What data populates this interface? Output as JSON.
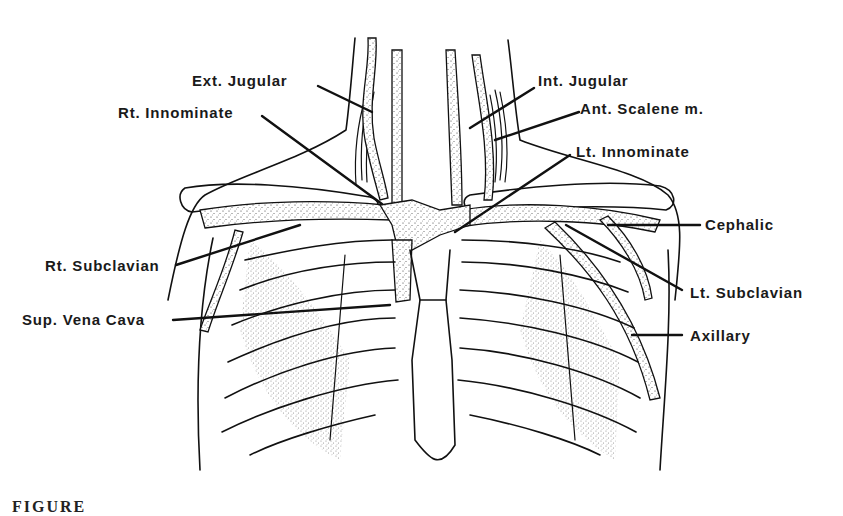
{
  "figure": {
    "labels": {
      "ext_jugular": "Ext. Jugular",
      "int_jugular": "Int. Jugular",
      "rt_innominate": "Rt. Innominate",
      "ant_scalene": "Ant. Scalene m.",
      "lt_innominate": "Lt. Innominate",
      "cephalic": "Cephalic",
      "rt_subclavian": "Rt. Subclavian",
      "lt_subclavian": "Lt. Subclavian",
      "sup_vena_cava": "Sup. Vena Cava",
      "axillary": "Axillary"
    },
    "caption_visible": "FIGURE"
  }
}
